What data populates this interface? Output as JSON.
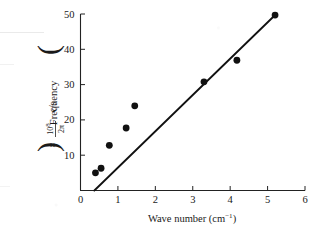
{
  "chart_data": {
    "type": "scatter",
    "title": "",
    "xlabel": "Wave number (cm⁻¹)",
    "xlabel_main": "Wave number (cm",
    "xlabel_sup": "−1",
    "xlabel_tail": ")",
    "ylabel": "Frequency ( × 10⁸/2π c/s )",
    "ylabel_prefix": "Frequency",
    "ylabel_times": "×",
    "ylabel_numerator": "10",
    "ylabel_numerator_exp": "8",
    "ylabel_denominator": "2π",
    "ylabel_units": "c/s",
    "xlim": [
      0,
      6
    ],
    "ylim": [
      0,
      50
    ],
    "xticks": [
      0,
      1,
      2,
      3,
      4,
      5,
      6
    ],
    "yticks": [
      10,
      20,
      30,
      40,
      50
    ],
    "grid": false,
    "legend": "none",
    "marker": "filled-circle",
    "marker_color": "#111111",
    "line_color": "#111111",
    "points": [
      {
        "x": 0.4,
        "y": 5.0
      },
      {
        "x": 0.55,
        "y": 6.3
      },
      {
        "x": 0.77,
        "y": 12.8
      },
      {
        "x": 1.22,
        "y": 17.7
      },
      {
        "x": 1.45,
        "y": 24.0
      },
      {
        "x": 3.3,
        "y": 30.8
      },
      {
        "x": 4.18,
        "y": 36.9
      },
      {
        "x": 5.2,
        "y": 49.7
      }
    ],
    "fit_line": {
      "x1": 0.37,
      "y1": 0.0,
      "x2": 5.23,
      "y2": 50.0
    }
  }
}
